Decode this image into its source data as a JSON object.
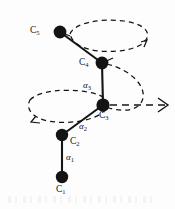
{
  "figure": {
    "type": "molecular-chain-diagram",
    "background_color": "#fdfdfd",
    "stroke_color": "#141414",
    "atoms": [
      {
        "id": "C1",
        "label": "C",
        "subscript": "1",
        "x": 62,
        "y": 177,
        "label_x": 57,
        "label_y": 187
      },
      {
        "id": "C2",
        "label": "C",
        "subscript": "2",
        "x": 62,
        "y": 135,
        "label_x": 70,
        "label_y": 141
      },
      {
        "id": "C3",
        "label": "C",
        "subscript": "3",
        "x": 103,
        "y": 105,
        "label_x": 100,
        "label_y": 115
      },
      {
        "id": "C4",
        "label": "C",
        "subscript": "4",
        "x": 102,
        "y": 63,
        "label_x": 80,
        "label_y": 63
      },
      {
        "id": "C5",
        "label": "C",
        "subscript": "5",
        "x": 60,
        "y": 32,
        "label_x": 30,
        "label_y": 31
      }
    ],
    "bonds": [
      {
        "from": "C1",
        "to": "C2"
      },
      {
        "from": "C2",
        "to": "C3"
      },
      {
        "from": "C3",
        "to": "C4"
      },
      {
        "from": "C4",
        "to": "C5"
      }
    ],
    "angles": [
      {
        "id": "a1",
        "label": "α",
        "subscript": "1",
        "x": 66,
        "y": 158,
        "bond": "C1-C2"
      },
      {
        "id": "a2",
        "label": "α",
        "subscript": "2",
        "x": 79,
        "y": 127,
        "bond": "C2-C3"
      },
      {
        "id": "a3",
        "label": "α",
        "subscript": "3",
        "x": 83,
        "y": 86,
        "bond": "C3-C4"
      }
    ],
    "rotation_paths": [
      {
        "id": "upper-ellipse",
        "kind": "dashed-ellipse",
        "cx": 108,
        "cy": 38,
        "rx": 40,
        "ry": 14
      },
      {
        "id": "lower-ellipse",
        "kind": "dashed-ellipse",
        "cx": 62,
        "cy": 109,
        "rx": 40,
        "ry": 15
      },
      {
        "id": "right-arc",
        "kind": "dashed-arc"
      },
      {
        "id": "right-arrow",
        "kind": "dashed-arrow"
      }
    ]
  }
}
